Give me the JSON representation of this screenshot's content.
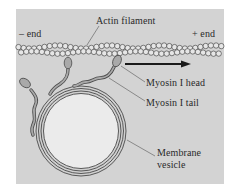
{
  "figure": {
    "panel_color": "#d3d3d3",
    "labels": {
      "actin_filament": "Actin filament",
      "minus_end": "– end",
      "plus_end": "+ end",
      "myosin_head": "Myosin I head",
      "myosin_tail": "Myosin I tail",
      "membrane_vesicle_line1": "Membrane",
      "membrane_vesicle_line2": "vesicle"
    },
    "arrow": {
      "direction": "toward plus end",
      "color": "#1a1a1a"
    },
    "colors": {
      "outline": "#4a4a4a",
      "myosin_fill": "#a9a9a9",
      "bead_fill": "#e6e6e6",
      "vesicle_fill": "#ebebeb",
      "leader_line": "#555555"
    }
  }
}
